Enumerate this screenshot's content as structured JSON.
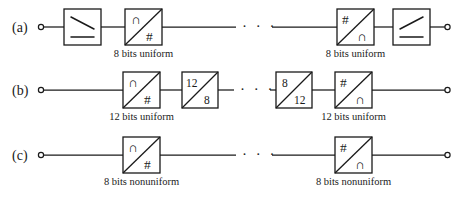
{
  "figure": {
    "ink_color": "#1a1a1a",
    "background_color": "#ffffff",
    "ellipsis": "· · ·"
  },
  "rows": [
    {
      "id": "row-a",
      "label": "(a)",
      "blocks": [
        {
          "kind": "filter",
          "name": "lowpass-filter-left",
          "slope": "down",
          "caption": ""
        },
        {
          "kind": "converter",
          "name": "adc-left",
          "top_left_glyph": "∩",
          "bottom_right_glyph": "#",
          "caption": "8 bits uniform"
        },
        {
          "kind": "converter",
          "name": "dac-right",
          "top_left_glyph": "#",
          "bottom_right_glyph": "∩",
          "caption": "8 bits uniform"
        },
        {
          "kind": "filter",
          "name": "lowpass-filter-right",
          "slope": "up",
          "caption": ""
        }
      ]
    },
    {
      "id": "row-b",
      "label": "(b)",
      "blocks": [
        {
          "kind": "converter",
          "name": "adc-left",
          "top_left_glyph": "∩",
          "bottom_right_glyph": "#",
          "caption": "12 bits uniform"
        },
        {
          "kind": "requantizer",
          "name": "compressor-12-to-8",
          "top_left_glyph": "12",
          "bottom_right_glyph": "8",
          "caption": ""
        },
        {
          "kind": "requantizer",
          "name": "expander-8-to-12",
          "top_left_glyph": "8",
          "bottom_right_glyph": "12",
          "caption": ""
        },
        {
          "kind": "converter",
          "name": "dac-right",
          "top_left_glyph": "#",
          "bottom_right_glyph": "∩",
          "caption": "12 bits uniform"
        }
      ]
    },
    {
      "id": "row-c",
      "label": "(c)",
      "blocks": [
        {
          "kind": "converter",
          "name": "adc-left",
          "top_left_glyph": "∩",
          "bottom_right_glyph": "#",
          "caption": "8 bits nonuniform"
        },
        {
          "kind": "converter",
          "name": "dac-right",
          "top_left_glyph": "#",
          "bottom_right_glyph": "∩",
          "caption": "8 bits nonuniform"
        }
      ]
    }
  ]
}
